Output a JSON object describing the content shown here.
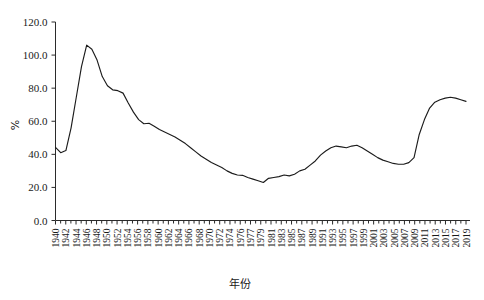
{
  "chart_data": {
    "type": "line",
    "title": "",
    "xlabel": "年份",
    "ylabel": "%",
    "xlim": [
      1940,
      2019
    ],
    "ylim": [
      0.0,
      120.0
    ],
    "grid": false,
    "legend": "none",
    "yticks": [
      "0.0",
      "20.0",
      "40.0",
      "60.0",
      "80.0",
      "100.0",
      "120.0"
    ],
    "ytick_values": [
      0.0,
      20.0,
      40.0,
      60.0,
      80.0,
      100.0,
      120.0
    ],
    "xtick_labels": [
      "1940",
      "1942",
      "1944",
      "1946",
      "1948",
      "1950",
      "1952",
      "1954",
      "1956",
      "1958",
      "1960",
      "1962",
      "1964",
      "1966",
      "1968",
      "1970",
      "1972",
      "1974",
      "1976",
      "1977",
      "1979",
      "1981",
      "1983",
      "1985",
      "1987",
      "1989",
      "1991",
      "1993",
      "1995",
      "1997",
      "1999",
      "2001",
      "2003",
      "2005",
      "2007",
      "2009",
      "2011",
      "2013",
      "2015",
      "2017",
      "2019"
    ],
    "x": [
      1940,
      1941,
      1942,
      1943,
      1944,
      1945,
      1946,
      1947,
      1948,
      1949,
      1950,
      1951,
      1952,
      1953,
      1954,
      1955,
      1956,
      1957,
      1958,
      1959,
      1960,
      1961,
      1962,
      1963,
      1964,
      1965,
      1966,
      1967,
      1968,
      1969,
      1970,
      1971,
      1972,
      1973,
      1974,
      1975,
      1976,
      1977,
      1978,
      1979,
      1980,
      1981,
      1982,
      1983,
      1984,
      1985,
      1986,
      1987,
      1988,
      1989,
      1990,
      1991,
      1992,
      1993,
      1994,
      1995,
      1996,
      1997,
      1998,
      1999,
      2000,
      2001,
      2002,
      2003,
      2004,
      2005,
      2006,
      2007,
      2008,
      2009,
      2010,
      2011,
      2012,
      2013,
      2014,
      2015,
      2016,
      2017,
      2018,
      2019
    ],
    "values": [
      44.2,
      41.0,
      42.3,
      56.0,
      74.5,
      93.0,
      106.0,
      103.5,
      97.0,
      87.0,
      81.5,
      79.0,
      78.5,
      77.0,
      71.0,
      65.5,
      61.0,
      58.5,
      58.8,
      57.0,
      55.0,
      53.5,
      52.0,
      50.5,
      48.5,
      46.5,
      44.0,
      41.5,
      39.0,
      37.0,
      35.0,
      33.5,
      32.0,
      30.0,
      28.5,
      27.5,
      27.3,
      26.0,
      25.0,
      24.0,
      23.0,
      25.5,
      26.0,
      26.5,
      27.5,
      27.0,
      28.0,
      30.0,
      31.0,
      33.5,
      36.0,
      39.5,
      42.0,
      44.0,
      45.0,
      44.5,
      44.0,
      45.0,
      45.5,
      44.0,
      42.0,
      40.0,
      38.0,
      36.5,
      35.5,
      34.5,
      34.0,
      34.0,
      35.0,
      38.0,
      52.0,
      61.0,
      68.0,
      71.5,
      73.0,
      74.0,
      74.5,
      74.0,
      73.0,
      72.0
    ]
  }
}
